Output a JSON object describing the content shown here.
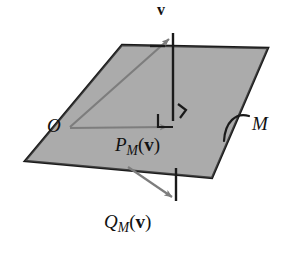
{
  "figure": {
    "type": "geometric-diagram",
    "width": 287,
    "height": 254,
    "background_color": "#ffffff"
  },
  "plane": {
    "name": "M",
    "label": "M",
    "fill_color": "#a9a9a9",
    "edge_color": "#1a1a1a",
    "corners": [
      {
        "x": 122,
        "y": 45
      },
      {
        "x": 268,
        "y": 48
      },
      {
        "x": 212,
        "y": 178
      },
      {
        "x": 25,
        "y": 161
      }
    ]
  },
  "points": {
    "origin": {
      "label": "O",
      "x": 68,
      "y": 128
    },
    "tip_v": {
      "x": 172,
      "y": 34
    },
    "foot_projection": {
      "x": 173,
      "y": 127
    },
    "tip_q": {
      "x": 176,
      "y": 200
    }
  },
  "labels": {
    "vector_v": {
      "text": "v",
      "style": "bold-upright"
    },
    "origin": {
      "text": "O",
      "style": "italic-serif"
    },
    "projection": {
      "base": "P",
      "subscript": "M",
      "open_paren": "(",
      "argument": "v",
      "close_paren": ")",
      "full_text": "P_M(v)"
    },
    "complement": {
      "base": "Q",
      "subscript": "M",
      "open_paren": "(",
      "argument": "v",
      "close_paren": ")",
      "full_text": "Q_M(v)"
    },
    "plane": {
      "text": "M",
      "style": "italic-serif"
    }
  },
  "strokes": {
    "vector_arrow_color": "#7d7d7d",
    "perpendicular_line_color": "#1a1a1a",
    "right_angle_color": "#1a1a1a",
    "leader_color": "#1a1a1a",
    "dash_color": "#1a1a1a"
  },
  "elements": {
    "arrow_o_to_v": "gray arrow from O up-right to tip of v",
    "arrow_o_to_p": "gray arrow from O horizontally right to foot of perpendicular",
    "arrow_to_q": "gray arrow from plane lower-left edge down-right to tip of Q",
    "perpendicular_segment": "black vertical line from v through plane down to Q",
    "right_angle_marker": "small square at foot of perpendicular inside plane",
    "tick_mark": "short hook tick beside right angle marker",
    "dash_mark": "short horizontal dash on plane top edge left of perpendicular",
    "leader_arc": "curved arc from plane right edge pointing to label M"
  }
}
